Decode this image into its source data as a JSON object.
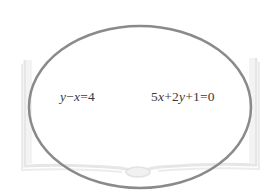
{
  "diagram": {
    "type": "set-ellipse",
    "ellipse": {
      "cx": 140,
      "cy": 107,
      "rx": 111,
      "ry": 81,
      "stroke": "#8a8a8a",
      "stroke_width": 2.5
    },
    "background_shape": {
      "name": "open-book",
      "stroke": "#e4e4e4"
    },
    "equations": [
      {
        "id": "eq-1",
        "text": "y−x=4",
        "parts": [
          {
            "t": "y",
            "var": true
          },
          {
            "t": "−",
            "var": false
          },
          {
            "t": "x",
            "var": true
          },
          {
            "t": "=4",
            "var": false
          }
        ]
      },
      {
        "id": "eq-2",
        "text": "5x+2y+1=0",
        "parts": [
          {
            "t": "5",
            "var": false
          },
          {
            "t": "x",
            "var": true
          },
          {
            "t": "+2",
            "var": false
          },
          {
            "t": "y",
            "var": true
          },
          {
            "t": "+1=0",
            "var": false
          }
        ]
      }
    ],
    "colors": {
      "text": "#3a3a3a",
      "ellipse": "#8a8a8a",
      "book": "#e4e4e4",
      "background": "#ffffff"
    }
  }
}
